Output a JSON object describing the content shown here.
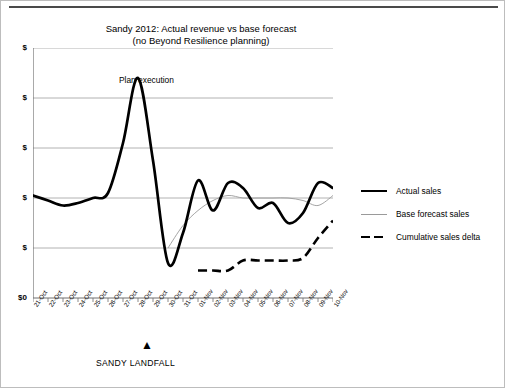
{
  "chart_data": {
    "type": "line",
    "title": "Sandy 2012: Actual revenue vs base forecast (no Beyond Resilience planning)",
    "title_line1": "Sandy 2012: Actual revenue vs base forecast",
    "title_line2": "(no Beyond Resilience planning)",
    "xlabel": "",
    "ylabel": "",
    "grid": true,
    "legend_position": "right",
    "categories": [
      "21-Oct",
      "22-Oct",
      "23-Oct",
      "24-Oct",
      "25-Oct",
      "26-Oct",
      "27-Oct",
      "28-Oct",
      "29-Oct",
      "30-Oct",
      "31-Oct",
      "01-Nov",
      "02-Nov",
      "03-Nov",
      "04-Nov",
      "05-Nov",
      "06-Nov",
      "07-Nov",
      "08-Nov",
      "09-Nov",
      "10-Nov"
    ],
    "ytick_labels": [
      "$",
      "$",
      "$",
      "$",
      "$",
      "$0"
    ],
    "yticks": [
      100,
      80,
      60,
      40,
      20,
      0
    ],
    "ylim": [
      0,
      100
    ],
    "series": [
      {
        "name": "Actual sales",
        "style": "thick-solid",
        "color": "#000000",
        "values": [
          41,
          39,
          37,
          38,
          40,
          42,
          62,
          88,
          55,
          14,
          26,
          47,
          35,
          46,
          44,
          36,
          38,
          30,
          34,
          46,
          44
        ]
      },
      {
        "name": "Base forecast sales",
        "style": "thin-solid",
        "color": "#9a9a9a",
        "values": [
          null,
          null,
          null,
          null,
          null,
          null,
          null,
          null,
          null,
          20,
          29,
          35,
          39,
          41,
          40,
          40,
          40,
          40,
          39,
          37,
          41
        ]
      },
      {
        "name": "Cumulative sales delta",
        "style": "dashed",
        "color": "#000000",
        "values": [
          null,
          null,
          null,
          null,
          null,
          null,
          null,
          null,
          null,
          null,
          null,
          11,
          11,
          11,
          15,
          15,
          15,
          15,
          16,
          24,
          31
        ]
      }
    ],
    "annotations": [
      {
        "name": "plan-execution",
        "text": "Plan execution",
        "type": "brace",
        "from": "25-Oct",
        "to": "09-Nov"
      },
      {
        "name": "sandy-landfall",
        "text": "SANDY LANDFALL",
        "type": "arrow",
        "at": "29-Oct"
      }
    ]
  },
  "legend": {
    "items": [
      {
        "label": "Actual sales",
        "key": "line-solid-thick-icon"
      },
      {
        "label": "Base forecast sales",
        "key": "line-solid-thin-icon"
      },
      {
        "label": "Cumulative sales delta",
        "key": "line-dashed-icon"
      }
    ]
  }
}
